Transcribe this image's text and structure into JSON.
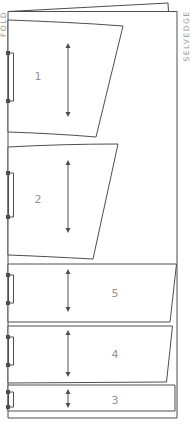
{
  "diagram": {
    "fold_label": "FOLD",
    "selvedge_label": "SELVEDGE",
    "pieces": [
      {
        "number": "1"
      },
      {
        "number": "2"
      },
      {
        "number": "5"
      },
      {
        "number": "4"
      },
      {
        "number": "3"
      }
    ],
    "icons": {
      "grainline-arrow-icon": "↕",
      "notch-marking": "▯"
    },
    "colors": {
      "line": "#4e4e4e",
      "label": "#949494",
      "background": "#ffffff"
    }
  }
}
